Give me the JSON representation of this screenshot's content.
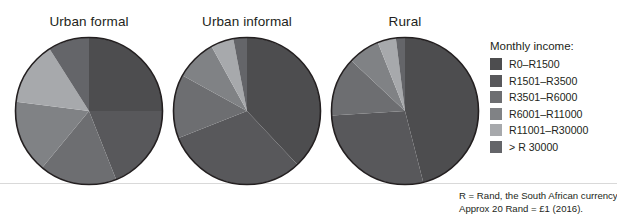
{
  "legend": {
    "title": "Monthly income:",
    "items": [
      {
        "label": "R0–R1500",
        "color": "#4d4d4f"
      },
      {
        "label": "R1501–R3500",
        "color": "#58585b"
      },
      {
        "label": "R3501–R6000",
        "color": "#6d6e71"
      },
      {
        "label": "R6001–R11000",
        "color": "#808285"
      },
      {
        "label": "R11001–R30000",
        "color": "#a7a9ac"
      },
      {
        "label": "> R 30000",
        "color": "#646569"
      }
    ]
  },
  "footnote": {
    "line1": "R = Rand, the South African currency.",
    "line2": "Approx 20 Rand = £1 (2016)."
  },
  "chart_data": {
    "type": "pie",
    "title": "",
    "legend_title": "Monthly income:",
    "legend_position": "right",
    "units": "percent of households",
    "categories": [
      "R0–R1500",
      "R1501–R3500",
      "R3501–R6000",
      "R6001–R11000",
      "R11001–R30000",
      "> R 30000"
    ],
    "colors": [
      "#4d4d4f",
      "#58585b",
      "#6d6e71",
      "#808285",
      "#a7a9ac",
      "#646569"
    ],
    "charts": [
      {
        "title": "Urban formal",
        "values": [
          25,
          19,
          17,
          16,
          14,
          9
        ],
        "cx": 88,
        "cy": 111,
        "r": 75
      },
      {
        "title": "Urban informal",
        "values": [
          38,
          31,
          14,
          9,
          5,
          3
        ],
        "cx": 246,
        "cy": 111,
        "r": 75
      },
      {
        "title": "Rural",
        "values": [
          46,
          28,
          13,
          7,
          4,
          2
        ],
        "cx": 404,
        "cy": 111,
        "r": 75
      }
    ]
  }
}
